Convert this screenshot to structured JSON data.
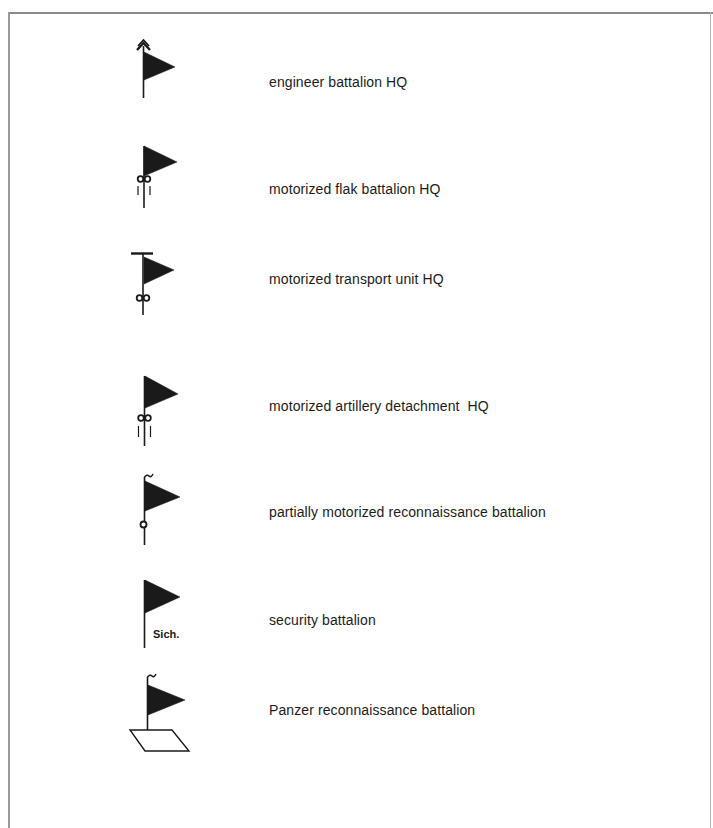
{
  "legend": {
    "entries": [
      {
        "symbol": "engineer-battalion-hq-flag-icon",
        "label": "engineer battalion HQ"
      },
      {
        "symbol": "motorized-flak-battalion-hq-flag-icon",
        "label": "motorized flak battalion HQ"
      },
      {
        "symbol": "motorized-transport-unit-hq-flag-icon",
        "label": "motorized transport unit HQ"
      },
      {
        "symbol": "motorized-artillery-detachment-hq-flag-icon",
        "label": "motorized artillery detachment  HQ"
      },
      {
        "symbol": "partially-motorized-reconnaissance-battalion-flag-icon",
        "label": "partially motorized reconnaissance battalion"
      },
      {
        "symbol": "security-battalion-flag-icon",
        "label": "security battalion",
        "symbol_text": "Sich."
      },
      {
        "symbol": "panzer-reconnaissance-battalion-flag-icon",
        "label": "Panzer reconnaissance battalion"
      }
    ]
  },
  "colors": {
    "ink": "#1a1a1a",
    "paper": "#ffffff",
    "frame": "#8a8a8a"
  }
}
